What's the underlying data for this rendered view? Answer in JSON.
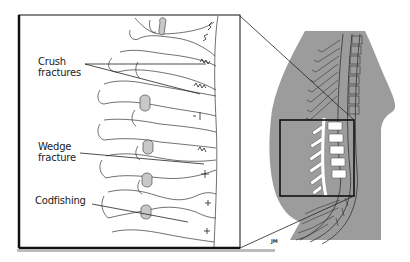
{
  "figure": {
    "labels": {
      "crush": [
        "Crush",
        "fractures"
      ],
      "wedge": [
        "Wedge",
        "fracture"
      ],
      "codfishing": [
        "Codfishing"
      ]
    },
    "signature": "JM",
    "colors": {
      "background": "#ffffff",
      "body_silhouette": "#9c9c9c",
      "lines": "#222222",
      "vertebra_shading": "#c8c8c8"
    },
    "parts": {
      "inset_panel": "magnified view of vertebrae",
      "body_silhouette": "side view of torso with spine",
      "callout_box": "highlighted thoracic region"
    }
  }
}
